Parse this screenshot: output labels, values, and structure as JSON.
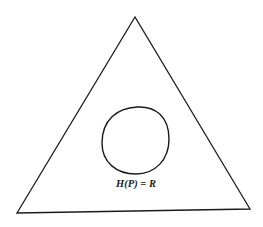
{
  "diagram": {
    "shapes": [
      {
        "name": "triangle",
        "kind": "outer-region"
      },
      {
        "name": "closed-curve",
        "kind": "inner-region"
      }
    ],
    "label": "H(P) = R",
    "stroke_color": "#1a1a1a",
    "background_color": "#ffffff"
  }
}
